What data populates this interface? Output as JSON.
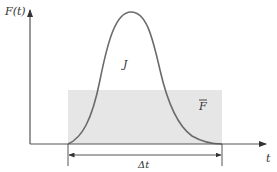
{
  "diagram": {
    "type": "impulse-force-time-graph",
    "y_axis_label": "F(t)",
    "x_axis_label": "t",
    "curve_label": "J",
    "average_force_label": "F",
    "average_force_bar": true,
    "interval_label": "Δt",
    "colors": {
      "axis": "#555555",
      "curve": "#6b6b6b",
      "shaded_rect": "#e6e6e6",
      "text": "#333333"
    }
  }
}
